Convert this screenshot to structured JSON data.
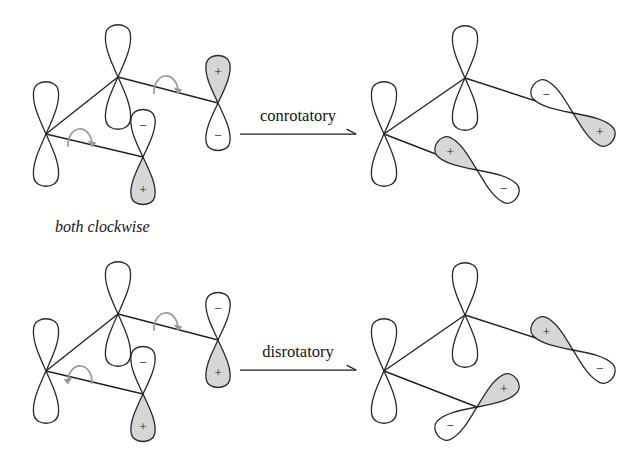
{
  "figure": {
    "background_color": "#ffffff",
    "ink_color": "#222222",
    "shaded_lobe_color": "#d6d6d6",
    "empty_lobe_color": "#ffffff",
    "rotation_arrow_color": "#9a9a9a"
  },
  "signs": {
    "plus": "+",
    "minus": "−"
  },
  "rows": [
    {
      "id": "conrotatory-row",
      "reaction_label": "conrotatory",
      "caption": "both clockwise",
      "caption_position": {
        "x": 55,
        "y": 232
      },
      "arrow": {
        "x1": 240,
        "y1": 134,
        "x2": 356,
        "y2": 134,
        "label_x": 298,
        "label_y": 121
      },
      "reactant": {
        "id": "conrotatory-reactant",
        "skeleton": [
          {
            "from": [
              46,
              134
            ],
            "to": [
              118,
              77
            ]
          },
          {
            "from": [
              118,
              77
            ],
            "to": [
              218,
              103
            ]
          },
          {
            "from": [
              46,
              134
            ],
            "to": [
              143,
              157
            ]
          }
        ],
        "orbitals": [
          {
            "name": "c1-orbital",
            "cx": 46,
            "cy": 134,
            "angle": 0,
            "length": 55,
            "width": 27,
            "top": {
              "fill": "empty",
              "sign": ""
            },
            "bottom": {
              "fill": "empty",
              "sign": ""
            }
          },
          {
            "name": "c2-orbital",
            "cx": 118,
            "cy": 77,
            "angle": 0,
            "length": 55,
            "width": 27,
            "top": {
              "fill": "empty",
              "sign": ""
            },
            "bottom": {
              "fill": "empty",
              "sign": ""
            }
          },
          {
            "name": "c3-orbital",
            "cx": 143,
            "cy": 157,
            "angle": 0,
            "length": 50,
            "width": 26,
            "top": {
              "fill": "empty",
              "sign": "−"
            },
            "bottom": {
              "fill": "shaded",
              "sign": "+"
            }
          },
          {
            "name": "c4-orbital",
            "cx": 218,
            "cy": 103,
            "angle": 0,
            "length": 50,
            "width": 26,
            "top": {
              "fill": "shaded",
              "sign": "+"
            },
            "bottom": {
              "fill": "empty",
              "sign": "−"
            }
          }
        ],
        "rotation_arrows": [
          {
            "name": "rotation-arrow-upper",
            "cx": 166,
            "cy": 86,
            "rx": 12,
            "ry": 16,
            "direction": "clockwise"
          },
          {
            "name": "rotation-arrow-lower",
            "cx": 80,
            "cy": 139,
            "rx": 12,
            "ry": 16,
            "direction": "clockwise"
          }
        ]
      },
      "product": {
        "id": "conrotatory-product",
        "skeleton": [
          {
            "from": [
              384,
              134
            ],
            "to": [
              465,
              78
            ]
          },
          {
            "from": [
              465,
              78
            ],
            "to": [
              573,
              113
            ]
          },
          {
            "from": [
              384,
              134
            ],
            "to": [
              477,
              170
            ]
          }
        ],
        "orbitals": [
          {
            "name": "c1-orbital",
            "cx": 384,
            "cy": 134,
            "angle": 0,
            "length": 55,
            "width": 27,
            "top": {
              "fill": "empty",
              "sign": ""
            },
            "bottom": {
              "fill": "empty",
              "sign": ""
            }
          },
          {
            "name": "c2-orbital",
            "cx": 465,
            "cy": 78,
            "angle": 0,
            "length": 55,
            "width": 27,
            "top": {
              "fill": "empty",
              "sign": ""
            },
            "bottom": {
              "fill": "empty",
              "sign": ""
            }
          },
          {
            "name": "c3-orbital",
            "cx": 477,
            "cy": 170,
            "angle": 125,
            "length": 51,
            "width": 25,
            "top": {
              "fill": "empty",
              "sign": "−"
            },
            "bottom": {
              "fill": "shaded",
              "sign": "+"
            }
          },
          {
            "name": "c4-orbital",
            "cx": 573,
            "cy": 113,
            "angle": 125,
            "length": 51,
            "width": 25,
            "top": {
              "fill": "shaded",
              "sign": "+"
            },
            "bottom": {
              "fill": "empty",
              "sign": "−"
            }
          }
        ],
        "rotation_arrows": []
      }
    },
    {
      "id": "disrotatory-row",
      "reaction_label": "disrotatory",
      "caption": "",
      "caption_position": {
        "x": 55,
        "y": 452
      },
      "arrow": {
        "x1": 240,
        "y1": 370,
        "x2": 356,
        "y2": 370,
        "label_x": 298,
        "label_y": 357
      },
      "reactant": {
        "id": "disrotatory-reactant",
        "skeleton": [
          {
            "from": [
              46,
              371
            ],
            "to": [
              118,
              314
            ]
          },
          {
            "from": [
              118,
              314
            ],
            "to": [
              218,
              340
            ]
          },
          {
            "from": [
              46,
              371
            ],
            "to": [
              143,
              394
            ]
          }
        ],
        "orbitals": [
          {
            "name": "c1-orbital",
            "cx": 46,
            "cy": 371,
            "angle": 0,
            "length": 55,
            "width": 27,
            "top": {
              "fill": "empty",
              "sign": ""
            },
            "bottom": {
              "fill": "empty",
              "sign": ""
            }
          },
          {
            "name": "c2-orbital",
            "cx": 118,
            "cy": 314,
            "angle": 0,
            "length": 55,
            "width": 27,
            "top": {
              "fill": "empty",
              "sign": ""
            },
            "bottom": {
              "fill": "empty",
              "sign": ""
            }
          },
          {
            "name": "c3-orbital",
            "cx": 143,
            "cy": 394,
            "angle": 0,
            "length": 50,
            "width": 26,
            "top": {
              "fill": "empty",
              "sign": "−"
            },
            "bottom": {
              "fill": "shaded",
              "sign": "+"
            }
          },
          {
            "name": "c4-orbital",
            "cx": 218,
            "cy": 340,
            "angle": 0,
            "length": 50,
            "width": 26,
            "top": {
              "fill": "empty",
              "sign": "−"
            },
            "bottom": {
              "fill": "shaded",
              "sign": "+"
            }
          }
        ],
        "rotation_arrows": [
          {
            "name": "rotation-arrow-upper",
            "cx": 166,
            "cy": 323,
            "rx": 12,
            "ry": 16,
            "direction": "clockwise"
          },
          {
            "name": "rotation-arrow-lower",
            "cx": 80,
            "cy": 376,
            "rx": 12,
            "ry": 16,
            "direction": "counterclockwise"
          }
        ]
      },
      "product": {
        "id": "disrotatory-product",
        "skeleton": [
          {
            "from": [
              384,
              371
            ],
            "to": [
              465,
              315
            ]
          },
          {
            "from": [
              465,
              315
            ],
            "to": [
              573,
              350
            ]
          },
          {
            "from": [
              384,
              371
            ],
            "to": [
              477,
              407
            ]
          }
        ],
        "orbitals": [
          {
            "name": "c1-orbital",
            "cx": 384,
            "cy": 371,
            "angle": 0,
            "length": 55,
            "width": 27,
            "top": {
              "fill": "empty",
              "sign": ""
            },
            "bottom": {
              "fill": "empty",
              "sign": ""
            }
          },
          {
            "name": "c2-orbital",
            "cx": 465,
            "cy": 315,
            "angle": 0,
            "length": 55,
            "width": 27,
            "top": {
              "fill": "empty",
              "sign": ""
            },
            "bottom": {
              "fill": "empty",
              "sign": ""
            }
          },
          {
            "name": "c3-orbital",
            "cx": 477,
            "cy": 407,
            "angle": 55,
            "length": 51,
            "width": 25,
            "top": {
              "fill": "shaded",
              "sign": "+"
            },
            "bottom": {
              "fill": "empty",
              "sign": "−"
            }
          },
          {
            "name": "c4-orbital",
            "cx": 573,
            "cy": 350,
            "angle": 125,
            "length": 51,
            "width": 25,
            "top": {
              "fill": "empty",
              "sign": "−"
            },
            "bottom": {
              "fill": "shaded",
              "sign": "+"
            }
          }
        ],
        "rotation_arrows": []
      }
    }
  ]
}
